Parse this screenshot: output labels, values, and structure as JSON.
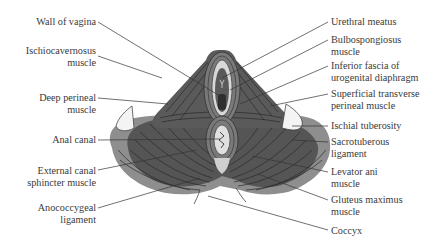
{
  "diagram": {
    "colors": {
      "muscle_dark": "#4a4a4a",
      "muscle_mid": "#6e6e6e",
      "muscle_light": "#9a9a9a",
      "fascia": "#d8d8d8",
      "line": "#333333",
      "label": "#3a3a3a"
    },
    "labels_left": [
      {
        "id": "wall-of-vagina",
        "line1": "Wall of vagina",
        "line2": ""
      },
      {
        "id": "ischiocavernosus",
        "line1": "Ischiocavernosus",
        "line2": "muscle"
      },
      {
        "id": "deep-perineal",
        "line1": "Deep perineal",
        "line2": "muscle"
      },
      {
        "id": "anal-canal",
        "line1": "Anal canal",
        "line2": ""
      },
      {
        "id": "external-canal-sphincter",
        "line1": "External canal",
        "line2": "sphincter muscle"
      },
      {
        "id": "anococcygeal",
        "line1": "Anococcygeal",
        "line2": "ligament"
      }
    ],
    "labels_right": [
      {
        "id": "urethral-meatus",
        "line1": "Urethral meatus",
        "line2": ""
      },
      {
        "id": "bulbospongiosus",
        "line1": "Bulbospongiosus",
        "line2": "muscle"
      },
      {
        "id": "inferior-fascia",
        "line1": "Inferior fascia of",
        "line2": "urogenital diaphragm"
      },
      {
        "id": "superficial-transverse",
        "line1": "Superficial transverse",
        "line2": "perineal muscle"
      },
      {
        "id": "ischial-tuberosity",
        "line1": "Ischial tuberosity",
        "line2": ""
      },
      {
        "id": "sacrotuberous",
        "line1": "Sacrotuberous",
        "line2": "ligament"
      },
      {
        "id": "levator-ani",
        "line1": "Levator ani",
        "line2": "muscle"
      },
      {
        "id": "gluteus-maximus",
        "line1": "Gluteus maximus",
        "line2": "muscle"
      },
      {
        "id": "coccyx",
        "line1": "Coccyx",
        "line2": ""
      }
    ]
  }
}
